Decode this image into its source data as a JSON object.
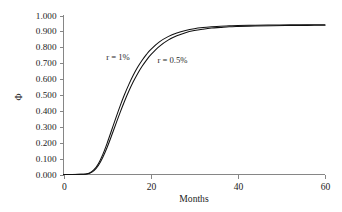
{
  "chart_data": {
    "type": "line",
    "title": "",
    "subtitle": "",
    "xlabel": "Months",
    "ylabel": "Φ",
    "xlim": [
      0,
      60
    ],
    "ylim": [
      0,
      1.0
    ],
    "grid": false,
    "legend_position": "inline-annotation",
    "background_color": "#ffffff",
    "axis_color": "#868686",
    "line_color": "#111111",
    "xticks": [
      0,
      20,
      40,
      60
    ],
    "xtick_labels": [
      "0",
      "20",
      "40",
      "60"
    ],
    "yticks": [
      0.0,
      0.1,
      0.2,
      0.3,
      0.4,
      0.5,
      0.6,
      0.7,
      0.8,
      0.9,
      1.0
    ],
    "ytick_labels": [
      "0.000",
      "0.100",
      "0.200",
      "0.300",
      "0.400",
      "0.500",
      "0.600",
      "0.700",
      "0.800",
      "0.900",
      "1.000"
    ],
    "x": [
      0,
      2,
      4,
      5,
      6,
      7,
      8,
      9,
      10,
      11,
      12,
      13,
      14,
      15,
      16,
      17,
      18,
      19,
      20,
      22,
      24,
      26,
      28,
      30,
      32,
      34,
      36,
      38,
      40,
      44,
      48,
      52,
      56,
      60
    ],
    "series": [
      {
        "name": "r = 1%",
        "label": "r = 1%",
        "color": "#111111",
        "annotation_x": 12.5,
        "annotation_y": 0.735,
        "values": [
          0.0,
          0.0,
          0.001,
          0.003,
          0.01,
          0.03,
          0.068,
          0.125,
          0.196,
          0.275,
          0.355,
          0.432,
          0.503,
          0.567,
          0.624,
          0.674,
          0.717,
          0.754,
          0.786,
          0.834,
          0.867,
          0.89,
          0.906,
          0.917,
          0.924,
          0.929,
          0.933,
          0.935,
          0.937,
          0.939,
          0.94,
          0.941,
          0.941,
          0.942
        ]
      },
      {
        "name": "r = 0.5%",
        "label": "r = 0.5%",
        "color": "#111111",
        "annotation_x": 25.0,
        "annotation_y": 0.712,
        "values": [
          0.0,
          0.0,
          0.001,
          0.002,
          0.008,
          0.025,
          0.057,
          0.107,
          0.17,
          0.242,
          0.317,
          0.391,
          0.461,
          0.525,
          0.583,
          0.634,
          0.679,
          0.718,
          0.752,
          0.806,
          0.845,
          0.872,
          0.892,
          0.905,
          0.914,
          0.921,
          0.925,
          0.929,
          0.931,
          0.934,
          0.936,
          0.937,
          0.938,
          0.939
        ]
      }
    ]
  }
}
